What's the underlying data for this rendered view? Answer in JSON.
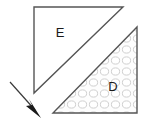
{
  "figure": {
    "canvas": {
      "width": 150,
      "height": 120,
      "background": "#ffffff"
    },
    "shapes": [
      {
        "id": "triangle-e",
        "kind": "right-triangle",
        "label": "E",
        "label_x": 60,
        "label_y": 34,
        "points": "34,7 123,7 34,93",
        "fill": "#ffffff",
        "fill_style": "solid-white",
        "stroke": "#555555",
        "stroke_width": 1.4,
        "right_angle_corner": "top-left"
      },
      {
        "id": "triangle-d",
        "kind": "right-triangle",
        "label": "D",
        "label_x": 113,
        "label_y": 88,
        "points": "137,27 137,113 53,113",
        "fill": "pattern-circles",
        "fill_style": "light-gray-circle-pattern",
        "stroke": "#555555",
        "stroke_width": 1.4,
        "right_angle_corner": "bottom-right"
      }
    ],
    "annotations": [
      {
        "id": "arrow-1",
        "kind": "arrow",
        "x1": 10,
        "y1": 82,
        "x2": 35,
        "y2": 110,
        "stroke": "#3a3a3a",
        "stroke_width": 1.2,
        "head_points": "40,117 27,105 32,104 30,100",
        "head_fill": "#1a1a1a",
        "direction": "down-right"
      }
    ],
    "pattern": {
      "id": "circle-pattern",
      "tile": 11,
      "circle_rx": 4.1,
      "circle_ry": 3.6,
      "stroke": "#c9c9c9",
      "stroke_width": 0.9,
      "fill": "#ffffff",
      "background": "#fdfdfd"
    },
    "colors": {
      "outline": "#555555",
      "label_text": "#1a1a1a",
      "arrow": "#1a1a1a",
      "pattern_line": "#c9c9c9",
      "paper": "#ffffff"
    }
  }
}
